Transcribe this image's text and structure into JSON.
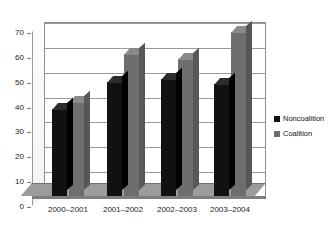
{
  "chart_data": {
    "type": "bar",
    "title": "",
    "subtitle": "",
    "xlabel": "",
    "ylabel": "",
    "categories": [
      "2000–2001",
      "2001–2002",
      "2002–2003",
      "2003–2004"
    ],
    "series": [
      {
        "name": "Noncoalition",
        "color": "#111111",
        "values": [
          35,
          46,
          47,
          45
        ]
      },
      {
        "name": "Coalition",
        "color": "#6e6e6e",
        "values": [
          38,
          57,
          55,
          66
        ]
      }
    ],
    "ylim": [
      0,
      70
    ],
    "yticks": [
      0,
      10,
      20,
      30,
      40,
      50,
      60,
      70
    ],
    "grid": true,
    "legend_position": "right",
    "style": "3d-column",
    "plot_background": "#ffffff",
    "gridline_color": "#9a9a9a",
    "floor_color": "#9c9c9c"
  },
  "legend": {
    "items": [
      {
        "label": "Noncoalition",
        "color": "#111111"
      },
      {
        "label": "Coalition",
        "color": "#6e6e6e"
      }
    ]
  }
}
